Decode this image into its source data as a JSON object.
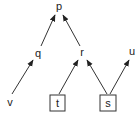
{
  "diagram": {
    "type": "directed-graph",
    "nodes": [
      {
        "id": "p",
        "label": "p",
        "x": 59,
        "y": 6,
        "boxed": false
      },
      {
        "id": "q",
        "label": "q",
        "x": 38,
        "y": 54,
        "boxed": false
      },
      {
        "id": "r",
        "label": "r",
        "x": 82,
        "y": 53,
        "boxed": false
      },
      {
        "id": "u",
        "label": "u",
        "x": 132,
        "y": 52,
        "boxed": false
      },
      {
        "id": "v",
        "label": "v",
        "x": 10,
        "y": 102,
        "boxed": false
      },
      {
        "id": "t",
        "label": "t",
        "x": 57,
        "y": 103,
        "boxed": true
      },
      {
        "id": "s",
        "label": "s",
        "x": 108,
        "y": 103,
        "boxed": true
      }
    ],
    "edges": [
      {
        "from": "q",
        "to": "p"
      },
      {
        "from": "r",
        "to": "p"
      },
      {
        "from": "v",
        "to": "q"
      },
      {
        "from": "t",
        "to": "r"
      },
      {
        "from": "s",
        "to": "r"
      },
      {
        "from": "s",
        "to": "u"
      }
    ]
  }
}
